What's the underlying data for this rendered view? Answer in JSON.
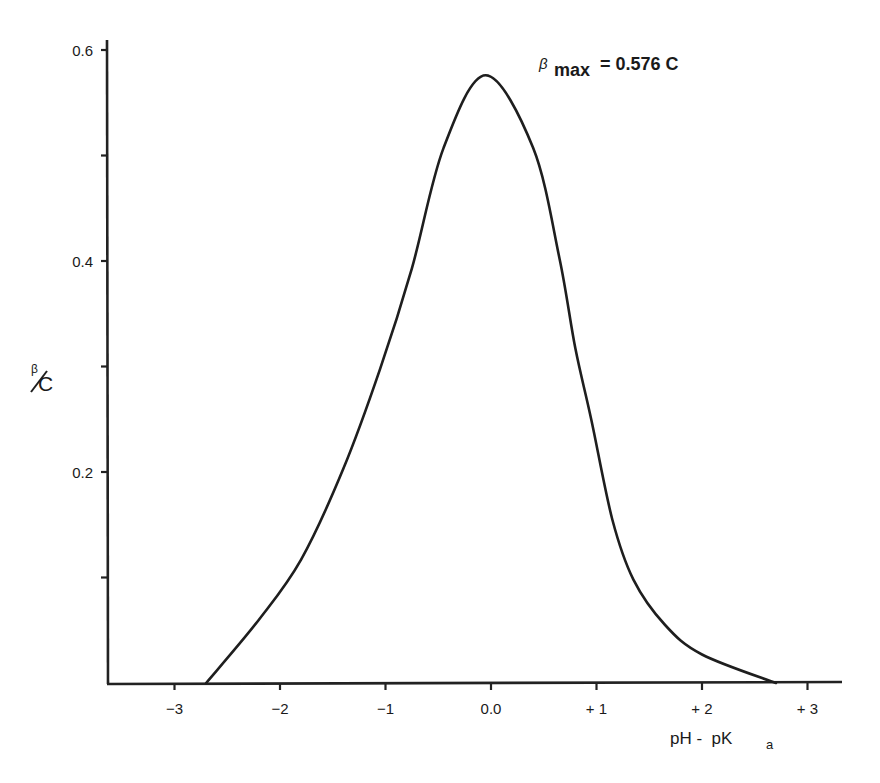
{
  "chart_data": {
    "type": "line",
    "title": "",
    "xlabel": "pH - pKa",
    "xlabel_main": "pH -  pK",
    "xlabel_sub": "a",
    "ylabel": "β/C",
    "ylabel_num": "β",
    "ylabel_den": "C",
    "xlim": [
      -3.5,
      3.5
    ],
    "ylim": [
      0,
      0.6
    ],
    "grid": false,
    "x_ticks": [
      {
        "value": -3,
        "label": "−3"
      },
      {
        "value": -2,
        "label": "−2"
      },
      {
        "value": -1,
        "label": "−1"
      },
      {
        "value": 0,
        "label": "0.0"
      },
      {
        "value": 1,
        "label": "+ 1"
      },
      {
        "value": 2,
        "label": "+ 2"
      },
      {
        "value": 3,
        "label": "+ 3"
      }
    ],
    "y_ticks": [
      {
        "value": 0.1,
        "label": ""
      },
      {
        "value": 0.2,
        "label": "0.2"
      },
      {
        "value": 0.3,
        "label": ""
      },
      {
        "value": 0.4,
        "label": "0.4"
      },
      {
        "value": 0.5,
        "label": ""
      },
      {
        "value": 0.6,
        "label": "0.6"
      }
    ],
    "annotation": {
      "symbol": "β",
      "subscript": "max",
      "text": "= 0.576 C"
    },
    "series": [
      {
        "name": "buffer capacity",
        "x": [
          -2.7,
          -2.2,
          -1.8,
          -1.4,
          -1.05,
          -0.75,
          -0.45,
          -0.05,
          0.4,
          0.65,
          0.8,
          0.95,
          1.15,
          1.35,
          1.65,
          2.0,
          2.7
        ],
        "y": [
          0.0,
          0.06,
          0.117,
          0.203,
          0.298,
          0.393,
          0.507,
          0.576,
          0.507,
          0.402,
          0.317,
          0.25,
          0.155,
          0.098,
          0.055,
          0.027,
          0.0
        ]
      }
    ],
    "peak": {
      "x": -0.05,
      "y": 0.576
    }
  }
}
